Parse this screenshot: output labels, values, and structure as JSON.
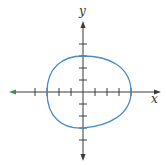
{
  "diagram": {
    "type": "graph-of-closed-curve",
    "axes": {
      "x_label": "x",
      "y_label": "y",
      "x_ticks": [
        -4,
        -3,
        -2,
        -1,
        1,
        2,
        3,
        4
      ],
      "y_ticks": [
        -4,
        -3,
        -2,
        -1,
        1,
        2,
        3,
        4
      ],
      "tick_labels_shown": false,
      "arrows": "both-ends"
    },
    "curve": {
      "shape": "egg-shaped closed loop",
      "intercepts": {
        "x_left": -3,
        "x_right": 4,
        "y_top": 3,
        "y_bottom": -3
      }
    },
    "colors": {
      "axis": "#3a3a3a",
      "curve": "#4a8cc8",
      "left_arrow": "#3f8f4a",
      "background": "#ffffff"
    }
  }
}
